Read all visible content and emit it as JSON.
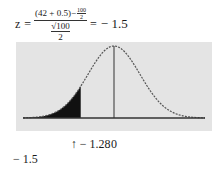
{
  "equation": {
    "lhs": "z",
    "equals": "=",
    "numerator_main": "(42 + 0.5)−",
    "numerator_frac_top": "100",
    "numerator_frac_bottom": "2",
    "denominator_sqrt": "√100",
    "denominator_bottom": "2",
    "equals2": "=",
    "result": "− 1.5"
  },
  "chart_data": {
    "type": "area",
    "title": "",
    "x_range": [
      -3.5,
      3.5
    ],
    "mean": 0,
    "sd": 1,
    "shaded_region": {
      "from": -3.5,
      "to": -1.28
    },
    "mean_line_at": 0,
    "tick_labels": [
      {
        "value": -1.28,
        "text": "↑ − 1.28"
      },
      {
        "value": 0,
        "text": "0"
      }
    ],
    "annotation": "− 1.5",
    "colors": {
      "curve": "#555555",
      "shade": "#111111",
      "background": "#e4e4e4",
      "axis": "#333333"
    }
  }
}
